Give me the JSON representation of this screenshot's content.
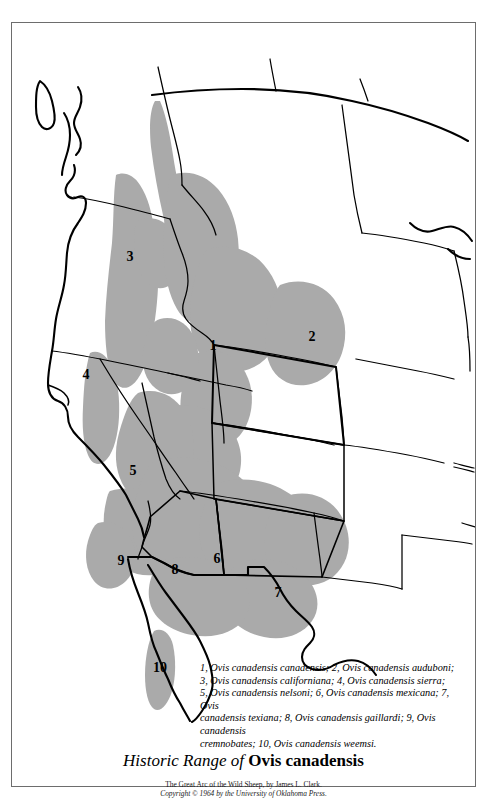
{
  "figure": {
    "title_italic_part": "Historic Range of",
    "title_bold_part": "Ovis canadensis",
    "credit_line_1": "The Great Arc of the Wild Sheep, by James L. Clark.",
    "credit_line_2": "Copyright © 1964 by the University of Oklahoma Press."
  },
  "caption": {
    "line_1": "1, Ovis canadensis canadensis; 2, Ovis canadensis auduboni;",
    "line_2": "3, Ovis canadensis californiana; 4, Ovis canadensis sierra;",
    "line_3": "5, Ovis canadensis nelsoni; 6, Ovis canadensis mexicana; 7, Ovis",
    "line_4": "canadensis texiana; 8, Ovis canadensis gaillardi; 9, Ovis canadensis",
    "line_5": "cremnobates; 10, Ovis canadensis weemsi."
  },
  "map": {
    "range_fill_color": "#aaaaaa",
    "outline_color": "#000000",
    "background_color": "#ffffff",
    "frame_color": "#6d6d6d",
    "labels": [
      {
        "id": "1",
        "text": "1",
        "x": 201,
        "y": 323,
        "subspecies": "Ovis canadensis canadensis"
      },
      {
        "id": "2",
        "text": "2",
        "x": 300,
        "y": 314,
        "subspecies": "Ovis canadensis auduboni"
      },
      {
        "id": "3",
        "text": "3",
        "x": 118,
        "y": 234,
        "subspecies": "Ovis canadensis californiana"
      },
      {
        "id": "4",
        "text": "4",
        "x": 74,
        "y": 352,
        "subspecies": "Ovis canadensis sierra"
      },
      {
        "id": "5",
        "text": "5",
        "x": 121,
        "y": 448,
        "subspecies": "Ovis canadensis nelsoni"
      },
      {
        "id": "6",
        "text": "6",
        "x": 205,
        "y": 536,
        "subspecies": "Ovis canadensis mexicana"
      },
      {
        "id": "7",
        "text": "7",
        "x": 266,
        "y": 570,
        "subspecies": "Ovis canadensis texiana"
      },
      {
        "id": "8",
        "text": "8",
        "x": 163,
        "y": 547,
        "subspecies": "Ovis canadensis gaillardi"
      },
      {
        "id": "9",
        "text": "9",
        "x": 109,
        "y": 538,
        "subspecies": "Ovis canadensis cremnobates"
      },
      {
        "id": "10",
        "text": "10",
        "x": 148,
        "y": 645,
        "subspecies": "Ovis canadensis weemsi"
      }
    ]
  }
}
